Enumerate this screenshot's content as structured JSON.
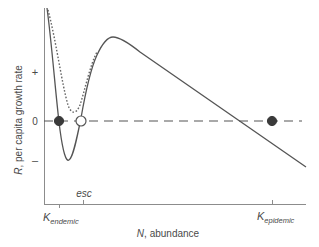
{
  "figure": {
    "y_axis": {
      "label_italic": "R",
      "label_rest": ", per capita growth rate",
      "ticks": {
        "plus": "+",
        "zero": "0",
        "minus": "–"
      }
    },
    "x_axis": {
      "label_italic": "N",
      "label_rest": ", abundance",
      "ticks": [
        {
          "id": "k_endemic",
          "main": "K",
          "sub": "endemic"
        },
        {
          "id": "esc",
          "main": "esc",
          "sub": ""
        },
        {
          "id": "k_epidemic",
          "main": "K",
          "sub": "epidemic"
        }
      ]
    },
    "curves": [
      {
        "name": "solid-growth-curve",
        "style": "solid"
      },
      {
        "name": "dotted-growth-curve",
        "style": "dotted"
      }
    ],
    "equilibria": [
      {
        "name": "k-endemic-point",
        "type": "stable",
        "fill": "filled"
      },
      {
        "name": "escape-threshold-point",
        "type": "unstable",
        "fill": "open"
      },
      {
        "name": "k-epidemic-point",
        "type": "stable",
        "fill": "filled"
      }
    ],
    "colors": {
      "curve": "#555555",
      "axis": "#8c8c8c",
      "text": "#4a4a4a",
      "dot": "#3a3a3a"
    }
  }
}
